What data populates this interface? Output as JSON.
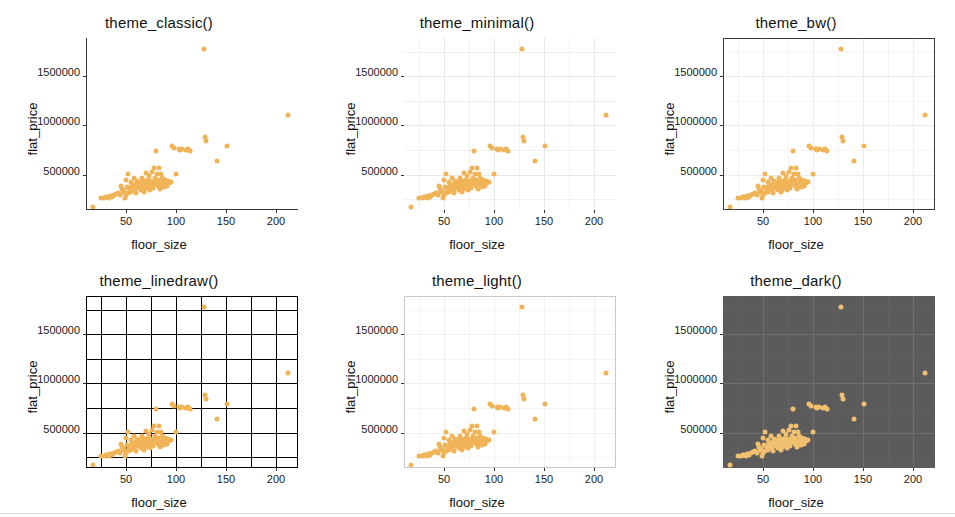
{
  "figure": {
    "n_panels": 6,
    "point_color": "#f0b458",
    "dark_point_color": "#f0c070",
    "dark_panel_color": "#5b5b5b"
  },
  "panels": [
    {
      "title": "theme_classic()",
      "theme": "classic",
      "xlabel": "floor_size",
      "ylabel": "flat_price"
    },
    {
      "title": "theme_minimal()",
      "theme": "minimal",
      "xlabel": "floor_size",
      "ylabel": "flat_price"
    },
    {
      "title": "theme_bw()",
      "theme": "bw",
      "xlabel": "floor_size",
      "ylabel": "flat_price"
    },
    {
      "title": "theme_linedraw()",
      "theme": "linedraw",
      "xlabel": "floor_size",
      "ylabel": "flat_price"
    },
    {
      "title": "theme_light()",
      "theme": "light",
      "xlabel": "floor_size",
      "ylabel": "flat_price"
    },
    {
      "title": "theme_dark()",
      "theme": "dark",
      "xlabel": "floor_size",
      "ylabel": "flat_price"
    }
  ],
  "chart_data": {
    "type": "scatter",
    "xlabel": "floor_size",
    "ylabel": "flat_price",
    "xlim": [
      10,
      222
    ],
    "ylim": [
      150000,
      1900000
    ],
    "xticks": [
      50,
      100,
      150,
      200
    ],
    "xticklabels": [
      "50",
      "100",
      "150",
      "200"
    ],
    "yticks": [
      500000,
      1000000,
      1500000
    ],
    "yticklabels": [
      "500000",
      "1000000",
      "1500000"
    ],
    "grid": true,
    "legend": "none",
    "series": [
      {
        "name": "flats",
        "x": [
          17,
          25,
          28,
          30,
          31,
          33,
          34,
          35,
          36,
          38,
          40,
          42,
          44,
          45,
          46,
          47,
          48,
          49,
          50,
          50,
          51,
          52,
          52,
          53,
          54,
          55,
          55,
          56,
          57,
          58,
          58,
          59,
          60,
          60,
          61,
          62,
          63,
          63,
          64,
          65,
          66,
          66,
          67,
          68,
          68,
          69,
          70,
          70,
          71,
          72,
          72,
          73,
          74,
          74,
          75,
          76,
          76,
          77,
          78,
          78,
          79,
          80,
          80,
          81,
          82,
          82,
          83,
          84,
          84,
          85,
          86,
          86,
          87,
          88,
          89,
          90,
          91,
          92,
          93,
          95,
          96,
          98,
          100,
          103,
          104,
          106,
          110,
          112,
          114,
          128,
          129,
          130,
          141,
          151,
          212
        ],
        "y": [
          205000,
          295000,
          300000,
          305000,
          310000,
          300000,
          315000,
          320000,
          310000,
          330000,
          340000,
          350000,
          330000,
          420000,
          390000,
          360000,
          370000,
          295000,
          330000,
          480000,
          410000,
          350000,
          545000,
          400000,
          385000,
          360000,
          465000,
          430000,
          395000,
          420000,
          500000,
          380000,
          440000,
          350000,
          470000,
          415000,
          445000,
          395000,
          460000,
          380000,
          500000,
          430000,
          405000,
          475000,
          355000,
          390000,
          550000,
          430000,
          465000,
          485000,
          395000,
          520000,
          440000,
          380000,
          470000,
          560000,
          420000,
          400000,
          605000,
          465000,
          500000,
          440000,
          780000,
          545000,
          415000,
          480000,
          600000,
          450000,
          390000,
          545000,
          430000,
          500000,
          465000,
          410000,
          480000,
          440000,
          420000,
          470000,
          455000,
          460000,
          830000,
          805000,
          540000,
          800000,
          790000,
          800000,
          790000,
          795000,
          780000,
          1815000,
          915000,
          875000,
          675000,
          825000,
          1140000
        ]
      }
    ]
  }
}
